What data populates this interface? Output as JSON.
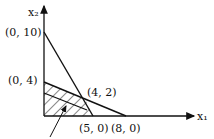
{
  "diagram": {
    "type": "linear-programming-feasible-region",
    "axes": {
      "x_label": "x₁",
      "y_label": "x₂"
    },
    "points": {
      "y_intercept_high": "(0, 10)",
      "y_intercept_low": "(0, 4)",
      "intersection": "(4, 2)",
      "x_intercept_a": "(5, 0)",
      "x_intercept_b": "(8, 0)"
    },
    "lines": [
      {
        "from": "(0, 10)",
        "to": "(5, 0)"
      },
      {
        "from": "(0, 4)",
        "to": "(8, 0)"
      }
    ],
    "shaded_region": "hatched feasible region bounded by axes and lines",
    "colors": {
      "stroke": "#111111",
      "background": "#ffffff"
    }
  }
}
